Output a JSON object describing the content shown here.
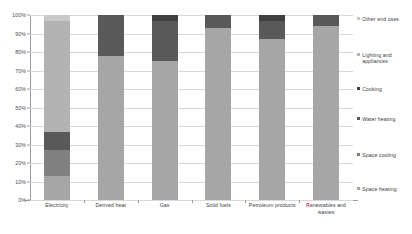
{
  "chart_data": {
    "type": "bar",
    "subtype": "stacked-100-percent",
    "title": "",
    "xlabel": "",
    "ylabel": "",
    "ylim": [
      0,
      100
    ],
    "ytick_labels": [
      "0%",
      "10%",
      "20%",
      "30%",
      "40%",
      "50%",
      "60%",
      "70%",
      "80%",
      "90%",
      "100%"
    ],
    "ytick_values": [
      0,
      10,
      20,
      30,
      40,
      50,
      60,
      70,
      80,
      90,
      100
    ],
    "grid": true,
    "legend_position": "right",
    "categories": [
      "Electricity",
      "Derived heat",
      "Gas",
      "Solid fuels",
      "Petroleum products",
      "Renewables and wastes"
    ],
    "series": [
      {
        "name": "Space heating",
        "color": "#a6a6a6",
        "values": [
          13,
          78,
          75,
          93,
          87,
          94
        ]
      },
      {
        "name": "Space cooling",
        "color": "#808080",
        "values": [
          14,
          0,
          0,
          0,
          0,
          0
        ]
      },
      {
        "name": "Water heating",
        "color": "#595959",
        "values": [
          10,
          22,
          22,
          7,
          10,
          6
        ]
      },
      {
        "name": "Cooking",
        "color": "#404040",
        "values": [
          0,
          0,
          3,
          0,
          3,
          0
        ]
      },
      {
        "name": "Lighting and appliances",
        "color": "#b3b3b3",
        "values": [
          60,
          0,
          0,
          0,
          0,
          0
        ]
      },
      {
        "name": "Other end uses",
        "color": "#c9c9c9",
        "values": [
          3,
          0,
          0,
          0,
          0,
          0
        ]
      }
    ]
  },
  "legend": {
    "items": [
      {
        "label": "Other end uses"
      },
      {
        "label": "Lighting and\nappliances"
      },
      {
        "label": "Cooking"
      },
      {
        "label": "Water heating"
      },
      {
        "label": "Space cooling"
      },
      {
        "label": "Space heating"
      }
    ]
  }
}
